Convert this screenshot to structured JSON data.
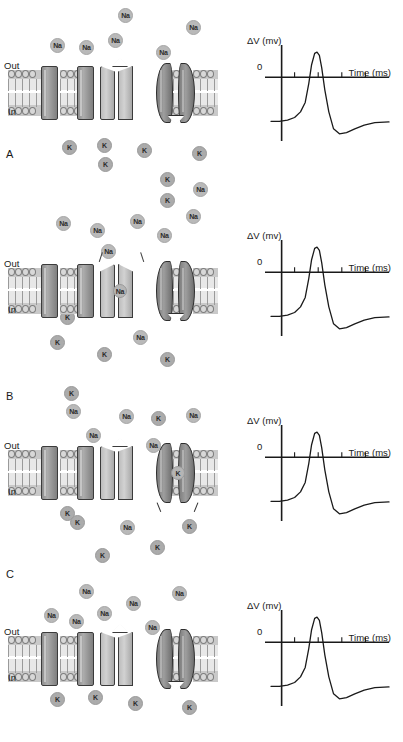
{
  "figure": {
    "panels": [
      {
        "letter": "A",
        "membrane": {
          "out_label": "Out",
          "in_label": "In"
        },
        "channel_state": {
          "sodium": "closed",
          "potassium": "closed",
          "ion_in_channel": ""
        },
        "outside_ions": [
          {
            "label": "Na",
            "x": 118,
            "y": 8
          },
          {
            "label": "Na",
            "x": 186,
            "y": 20
          },
          {
            "label": "Na",
            "x": 50,
            "y": 38
          },
          {
            "label": "Na",
            "x": 79,
            "y": 40
          },
          {
            "label": "Na",
            "x": 108,
            "y": 33
          },
          {
            "label": "Na",
            "x": 156,
            "y": 45
          },
          {
            "label": "K",
            "x": 60,
            "y": 70
          }
        ],
        "inside_ions": [
          {
            "label": "K",
            "x": 62,
            "y": 140
          },
          {
            "label": "K",
            "x": 97,
            "y": 138
          },
          {
            "label": "K",
            "x": 137,
            "y": 143
          },
          {
            "label": "K",
            "x": 192,
            "y": 146
          },
          {
            "label": "K",
            "x": 98,
            "y": 157
          },
          {
            "label": "K",
            "x": 160,
            "y": 172
          },
          {
            "label": "Na",
            "x": 193,
            "y": 182
          }
        ]
      },
      {
        "letter": "B",
        "membrane": {
          "out_label": "Out",
          "in_label": "In"
        },
        "channel_state": {
          "sodium": "open",
          "potassium": "closed",
          "ion_in_channel": "Na"
        },
        "outside_ions": [
          {
            "label": "K",
            "x": 160,
            "y": 3
          },
          {
            "label": "Na",
            "x": 56,
            "y": 26
          },
          {
            "label": "Na",
            "x": 90,
            "y": 33
          },
          {
            "label": "Na",
            "x": 130,
            "y": 24
          },
          {
            "label": "Na",
            "x": 186,
            "y": 19
          },
          {
            "label": "Na",
            "x": 157,
            "y": 38
          },
          {
            "label": "Na",
            "x": 101,
            "y": 54
          }
        ],
        "inside_ions": [
          {
            "label": "K",
            "x": 60,
            "y": 120
          },
          {
            "label": "Na",
            "x": 133,
            "y": 140
          },
          {
            "label": "K",
            "x": 50,
            "y": 145
          },
          {
            "label": "K",
            "x": 97,
            "y": 157
          },
          {
            "label": "K",
            "x": 160,
            "y": 162
          }
        ]
      },
      {
        "letter": "C",
        "membrane": {
          "out_label": "Out",
          "in_label": "In"
        },
        "channel_state": {
          "sodium": "closed",
          "potassium": "open",
          "ion_in_channel": "K"
        },
        "outside_ions": [
          {
            "label": "K",
            "x": 64,
            "y": 6
          },
          {
            "label": "Na",
            "x": 66,
            "y": 24
          },
          {
            "label": "Na",
            "x": 119,
            "y": 29
          },
          {
            "label": "K",
            "x": 151,
            "y": 31
          },
          {
            "label": "Na",
            "x": 186,
            "y": 28
          },
          {
            "label": "Na",
            "x": 86,
            "y": 48
          },
          {
            "label": "Na",
            "x": 146,
            "y": 58
          }
        ],
        "inside_ions": [
          {
            "label": "K",
            "x": 60,
            "y": 126
          },
          {
            "label": "K",
            "x": 70,
            "y": 135
          },
          {
            "label": "Na",
            "x": 120,
            "y": 140
          },
          {
            "label": "K",
            "x": 182,
            "y": 139
          },
          {
            "label": "K",
            "x": 150,
            "y": 160
          },
          {
            "label": "K",
            "x": 95,
            "y": 168
          }
        ]
      },
      {
        "letter": "",
        "membrane": {
          "out_label": "Out",
          "in_label": "In"
        },
        "channel_state": {
          "sodium": "closed",
          "potassium": "closed",
          "ion_in_channel": ""
        },
        "outside_ions": [
          {
            "label": "Na",
            "x": 79,
            "y": 14
          },
          {
            "label": "Na",
            "x": 172,
            "y": 16
          },
          {
            "label": "Na",
            "x": 126,
            "y": 26
          },
          {
            "label": "Na",
            "x": 44,
            "y": 38
          },
          {
            "label": "Na",
            "x": 69,
            "y": 44
          },
          {
            "label": "Na",
            "x": 97,
            "y": 36
          },
          {
            "label": "Na",
            "x": 145,
            "y": 50
          }
        ],
        "inside_ions": [
          {
            "label": "K",
            "x": 50,
            "y": 122
          },
          {
            "label": "K",
            "x": 88,
            "y": 120
          },
          {
            "label": "K",
            "x": 128,
            "y": 126
          },
          {
            "label": "K",
            "x": 182,
            "y": 130
          }
        ]
      }
    ]
  },
  "chart_data": {
    "type": "line",
    "title": "",
    "ylabel": "ΔV (mv)",
    "xlabel": "Time (ms)",
    "zero_label": "0",
    "grid": false,
    "legend": "none",
    "xlim": [
      0,
      5
    ],
    "ylim": [
      -95,
      45
    ],
    "x_ticks": [
      1,
      2,
      3,
      4
    ],
    "x_tick_labels": [
      "",
      "",
      "",
      ""
    ],
    "y_ticks": [
      0
    ],
    "series": [
      {
        "name": "Action potential",
        "x": [
          0.0,
          0.35,
          0.7,
          1.0,
          1.25,
          1.45,
          1.6,
          1.72,
          1.85,
          1.95,
          2.05,
          2.15,
          2.28,
          2.45,
          2.65,
          2.9,
          3.2,
          3.55,
          3.95,
          4.4,
          5.0
        ],
        "values": [
          -70,
          -70,
          -68,
          -64,
          -55,
          -40,
          -10,
          20,
          38,
          40,
          35,
          15,
          -20,
          -55,
          -82,
          -90,
          -88,
          -82,
          -76,
          -72,
          -71
        ]
      }
    ]
  }
}
